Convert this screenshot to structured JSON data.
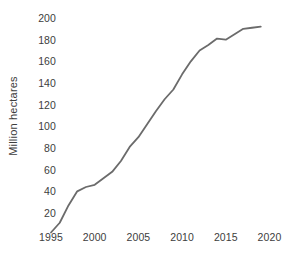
{
  "chart_data": {
    "type": "line",
    "title": "",
    "subtitle": "",
    "xlabel": "",
    "ylabel": "Million hectares",
    "xlim": [
      1995,
      2020
    ],
    "ylim": [
      0,
      205
    ],
    "grid": false,
    "legend": false,
    "legend_position": "none",
    "line_color": "#6b6b6b",
    "text_color": "#3d3d3d",
    "background_color": "#ffffff",
    "x_tick_labels": [
      "1995",
      "2000",
      "2005",
      "2010",
      "2015",
      "2020"
    ],
    "x_tick_values": [
      1995,
      2000,
      2005,
      2010,
      2015,
      2020
    ],
    "y_tick_labels": [
      "200",
      "180",
      "160",
      "140",
      "120",
      "100",
      "80",
      "60",
      "40",
      "20"
    ],
    "y_tick_values": [
      200,
      180,
      160,
      140,
      120,
      100,
      80,
      60,
      40,
      20
    ],
    "x": [
      1995,
      1996,
      1997,
      1998,
      1999,
      2000,
      2001,
      2002,
      2003,
      2004,
      2005,
      2006,
      2007,
      2008,
      2009,
      2010,
      2011,
      2012,
      2013,
      2014,
      2015,
      2016,
      2017,
      2018,
      2019
    ],
    "series": [
      {
        "name": "Area of genetically modified crops",
        "values": [
          2,
          11,
          27,
          40,
          44,
          46,
          52,
          58,
          68,
          81,
          90,
          102,
          114,
          125,
          134,
          148,
          160,
          170,
          175,
          181,
          180,
          185,
          190,
          191,
          192
        ]
      }
    ]
  }
}
